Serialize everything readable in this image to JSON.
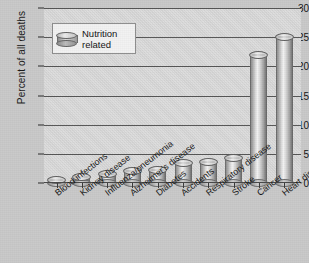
{
  "chart_data": {
    "type": "bar",
    "title": "",
    "xlabel": "",
    "ylabel": "Percent of all deaths",
    "ylim": [
      0,
      30
    ],
    "yticks": [
      0,
      5,
      10,
      15,
      20,
      25,
      30
    ],
    "grid": true,
    "legend": {
      "position": "upper-left",
      "entries": [
        "Nutrition related"
      ],
      "line1": "Nutrition",
      "line2": "related",
      "icon": "cylinder-swatch"
    },
    "categories": [
      "Blood infections",
      "Kidney disease",
      "Influenza/pneumonia",
      "Alzheimer's disease",
      "Diabetes",
      "Accidents",
      "Respiratory disease",
      "Stroke",
      "Cancer",
      "Heart disease"
    ],
    "values": [
      1.2,
      1.7,
      2.2,
      2.8,
      2.9,
      4.2,
      4.3,
      4.9,
      22.6,
      25.7
    ],
    "series": [
      {
        "name": "Nutrition related",
        "values": [
          1.2,
          1.7,
          2.2,
          2.8,
          2.9,
          4.2,
          4.3,
          4.9,
          22.6,
          25.7
        ]
      }
    ],
    "colors": {
      "plot_background": "#d7d7d7",
      "page_background": "#c9c9c9",
      "gridline": "#565656",
      "bar_fill": "#d3d3d3",
      "bar_edge": "#6d6d6d",
      "text": "#141414"
    }
  }
}
